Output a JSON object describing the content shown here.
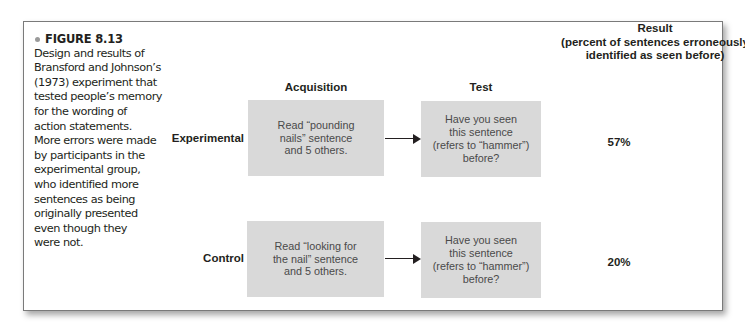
{
  "figure": {
    "label": "FIGURE 8.13",
    "bullet_color": "#9a9a9a",
    "caption": "Design and results of Bransford and Johnson's (1973) experiment that tested people's memory for the wording of action statements. More errors were made by participants in the experimental group, who identified more sentences as being originally presented even though they were not.",
    "caption_lines": [
      "Design and results of",
      "Bransford and Johnson’s",
      "(1973) experiment that",
      "tested people’s memory",
      "for the wording of",
      "action statements.",
      "More errors were made",
      "by participants in the",
      "experimental group,",
      "who identified more",
      "sentences as being",
      "originally presented",
      "even though they",
      "were not."
    ]
  },
  "columns": {
    "acquisition": "Acquisition",
    "test": "Test",
    "result_title": "Result",
    "result_subtitle_1": "(percent of sentences erroneously",
    "result_subtitle_2": "identified as seen before)"
  },
  "rows": [
    {
      "label": "Experimental",
      "acquisition_lines": [
        "Read “pounding",
        "nails” sentence",
        "and 5 others."
      ],
      "test_lines": [
        "Have you seen",
        "this sentence",
        "(refers to “hammer”)",
        "before?"
      ],
      "result": "57%"
    },
    {
      "label": "Control",
      "acquisition_lines": [
        "Read “looking for",
        "the nail” sentence",
        "and 5 others."
      ],
      "test_lines": [
        "Have you seen",
        "this sentence",
        "(refers to “hammer”)",
        "before?"
      ],
      "result": "20%"
    }
  ],
  "colors": {
    "box_fill": "#d9d9d9",
    "text": "#231f20",
    "box_text": "#4a4a4a",
    "frame_border": "#7a7a7a"
  }
}
